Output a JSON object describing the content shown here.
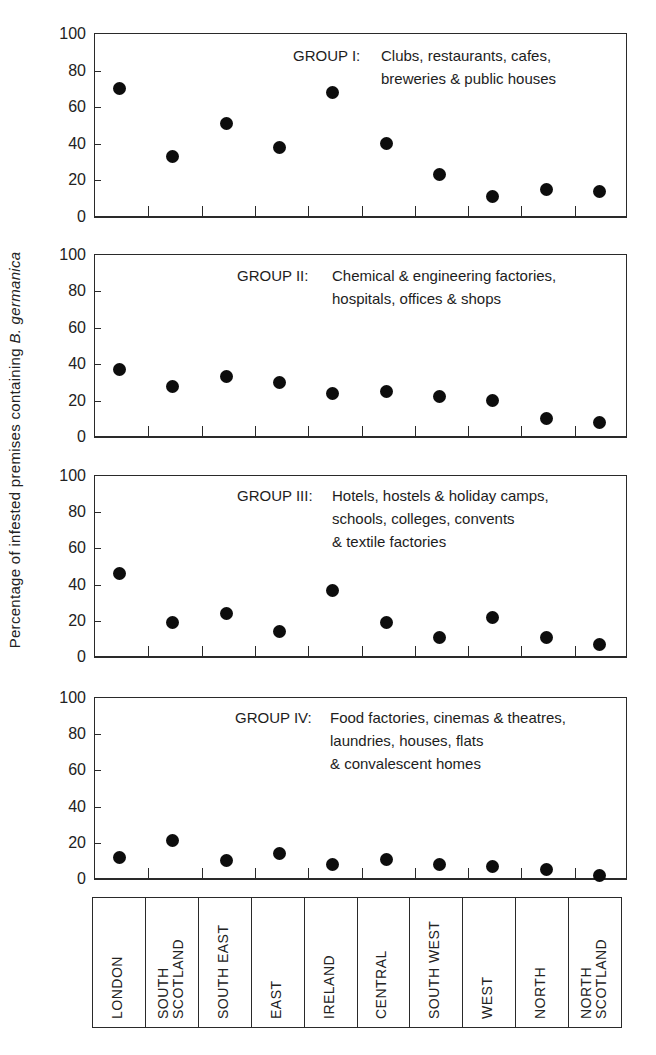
{
  "chart_data": {
    "type": "scatter",
    "ylabel": "Percentage of infested premises containing B. germanica",
    "ylabel_plain": "Percentage of infested premises containing ",
    "ylabel_italic": "B. germanica",
    "ylim": [
      0,
      100
    ],
    "yticks": [
      0,
      20,
      40,
      60,
      80,
      100
    ],
    "categories": [
      "LONDON",
      "SOUTH SCOTLAND",
      "SOUTH EAST",
      "EAST",
      "IRELAND",
      "CENTRAL",
      "SOUTH WEST",
      "WEST",
      "NORTH",
      "NORTH SCOTLAND"
    ],
    "category_labels": [
      "LONDON",
      "SOUTH\nSCOTLAND",
      "SOUTH EAST",
      "EAST",
      "IRELAND",
      "CENTRAL",
      "SOUTH WEST",
      "WEST",
      "NORTH",
      "NORTH\nSCOTLAND"
    ],
    "grid": false,
    "legend": null,
    "panels": [
      {
        "name": "GROUP I",
        "prefix": "GROUP  I:",
        "description_lines": [
          "Clubs, restaurants, cafes,",
          "breweries & public houses"
        ],
        "values": [
          70,
          33,
          51,
          38,
          68,
          40,
          23,
          11,
          15,
          14
        ]
      },
      {
        "name": "GROUP II",
        "prefix": "GROUP II:",
        "description_lines": [
          "Chemical & engineering factories,",
          "hospitals, offices & shops"
        ],
        "values": [
          37,
          28,
          33,
          30,
          24,
          25,
          22,
          20,
          10,
          8
        ]
      },
      {
        "name": "GROUP III",
        "prefix": "GROUP III:",
        "description_lines": [
          "Hotels, hostels & holiday camps,",
          "schools, colleges, convents",
          "& textile factories"
        ],
        "values": [
          46,
          19,
          24,
          14,
          37,
          19,
          11,
          22,
          11,
          7
        ]
      },
      {
        "name": "GROUP IV",
        "prefix": "GROUP IV:",
        "description_lines": [
          "Food factories, cinemas & theatres,",
          "laundries, houses, flats",
          "& convalescent homes"
        ],
        "values": [
          12,
          21,
          10,
          14,
          8,
          11,
          8,
          7,
          5,
          2
        ]
      }
    ]
  },
  "layout": {
    "panels": [
      {
        "top": 33,
        "height": 185,
        "title_left": 293,
        "title_top": 44,
        "desc_offset": 88
      },
      {
        "top": 254,
        "height": 184,
        "title_left": 237,
        "title_top": 264,
        "desc_offset": 95
      },
      {
        "top": 475,
        "height": 183,
        "title_left": 237,
        "title_top": 484,
        "desc_offset": 95
      },
      {
        "top": 697,
        "height": 183,
        "title_left": 235,
        "title_top": 706,
        "desc_offset": 95
      }
    ],
    "colors": {
      "ink": "#1a1a1a",
      "dot": "#0d0d0d",
      "background": "#ffffff"
    }
  }
}
